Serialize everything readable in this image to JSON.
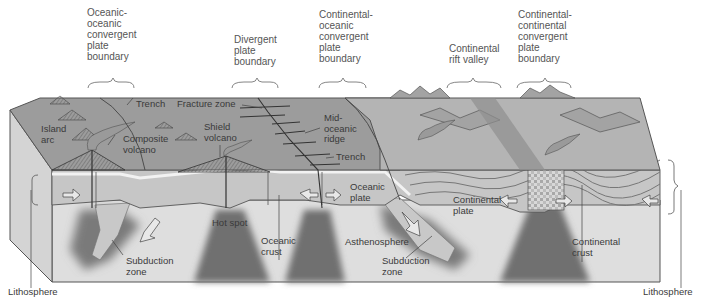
{
  "diagram": {
    "type": "plate-tectonics-block-diagram",
    "colors": {
      "background": "#ffffff",
      "ocean_surface": "#9a9a9a",
      "lithosphere": "#c8c8c8",
      "asthenosphere": "#dcdcdc",
      "plume": "#6e6e6e",
      "crust_line": "#efefef",
      "mountains": "#a9a9a9",
      "text": "#3a3a3a"
    },
    "boundary_labels": [
      {
        "id": "oceanic-oceanic",
        "text": "Oceanic-\noceanic\nconvergent\nplate\nboundary"
      },
      {
        "id": "divergent",
        "text": "Divergent\nplate\nboundary"
      },
      {
        "id": "continental-oceanic",
        "text": "Continental-\noceanic\nconvergent\nplate\nboundary"
      },
      {
        "id": "rift",
        "text": "Continental\nrift valley"
      },
      {
        "id": "continental-continental",
        "text": "Continental-\ncontinental\nconvergent\nplate\nboundary"
      }
    ],
    "feature_labels": {
      "island_arc": "Island\narc",
      "trench_left": "Trench",
      "composite_volcano": "Composite\nvolcano",
      "fracture_zone": "Fracture zone",
      "shield_volcano": "Shield\nvolcano",
      "mid_oceanic_ridge": "Mid-\noceanic\nridge",
      "trench_right": "Trench",
      "oceanic_plate": "Oceanic\nplate",
      "continental_plate": "Continental\nplate",
      "hot_spot": "Hot spot",
      "oceanic_crust": "Oceanic\ncrust",
      "asthenosphere": "Asthenosphere",
      "subduction_zone_left": "Subduction\nzone",
      "subduction_zone_right": "Subduction\nzone",
      "continental_crust": "Continental\ncrust",
      "lithosphere_left": "Lithosphere",
      "lithosphere_right": "Lithosphere"
    }
  }
}
